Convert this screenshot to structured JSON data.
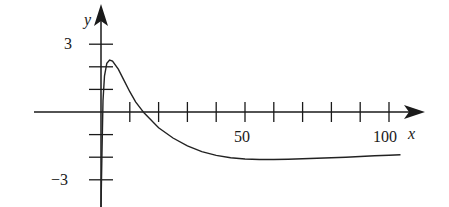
{
  "chart_data": {
    "type": "line",
    "title": "",
    "xlabel": "x",
    "ylabel": "y",
    "xlim": [
      0,
      112
    ],
    "ylim": [
      -4,
      4.5
    ],
    "x_ticks": [
      10,
      20,
      30,
      40,
      50,
      60,
      70,
      80,
      90,
      100
    ],
    "x_tick_labels": [
      {
        "value": 50,
        "label": "50"
      },
      {
        "value": 100,
        "label": "100"
      }
    ],
    "y_ticks": [
      -3,
      -2,
      -1,
      1,
      2,
      3
    ],
    "y_tick_labels": [
      {
        "value": 3,
        "label": "3"
      },
      {
        "value": -3,
        "label": "−3"
      }
    ],
    "grid": false,
    "legend": null,
    "series": [
      {
        "name": "curve",
        "x": [
          0,
          0.3,
          0.7,
          1.2,
          2,
          3,
          4,
          6,
          8,
          10,
          12,
          15,
          20,
          25,
          30,
          35,
          40,
          45,
          50,
          55,
          60,
          65,
          70,
          75,
          80,
          85,
          90,
          95,
          100,
          104
        ],
        "y": [
          -5.2,
          -2,
          0.5,
          1.6,
          2.15,
          2.3,
          2.25,
          1.9,
          1.4,
          0.9,
          0.45,
          -0.05,
          -0.7,
          -1.15,
          -1.5,
          -1.75,
          -1.92,
          -2.02,
          -2.08,
          -2.1,
          -2.1,
          -2.09,
          -2.07,
          -2.05,
          -2.02,
          -2.0,
          -1.97,
          -1.94,
          -1.91,
          -1.89
        ]
      }
    ]
  },
  "labels": {
    "y_axis": "y",
    "x_axis": "x",
    "tick_3": "3",
    "tick_neg3": "−3",
    "tick_50": "50",
    "tick_100": "100"
  }
}
